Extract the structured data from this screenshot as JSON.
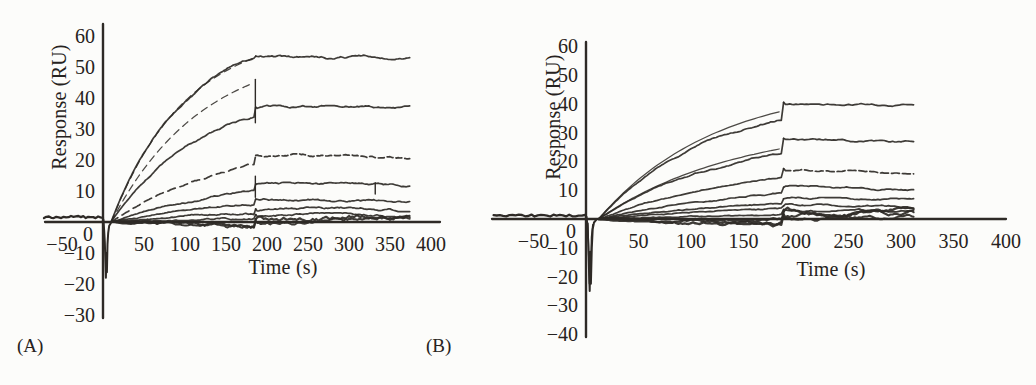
{
  "figure": {
    "background": "#fcfcfa",
    "ink": "#2e2a26",
    "text_color": "#262220"
  },
  "chart_data": [
    {
      "id": "A",
      "panel_label": "(A)",
      "type": "line",
      "title": "",
      "xlabel": "Time (s)",
      "ylabel": "Response (RU)",
      "x_ticks": [
        -50,
        50,
        100,
        150,
        200,
        250,
        300,
        350,
        400
      ],
      "y_ticks": [
        60,
        50,
        40,
        30,
        20,
        10,
        0,
        -10,
        -20,
        -30
      ],
      "xlim": [
        -75,
        415
      ],
      "ylim": [
        -33,
        63
      ],
      "grid": false,
      "legend": null,
      "injection": {
        "t_start": 10,
        "t_assoc_end": 185,
        "t_curve_end": 375,
        "t_baseline_start": -72,
        "baseline_level": 1.6,
        "neg_spike_min": -18,
        "neg_spike_double": false
      },
      "series": [
        {
          "name": "curve-1",
          "assoc_end": 53,
          "plateau": 53.5,
          "plateau_end": 53,
          "k": 0.011,
          "fit_end": 53,
          "fit_dash": "7 5"
        },
        {
          "name": "curve-2",
          "assoc_end": 34,
          "plateau": 37,
          "plateau_end": 36.8,
          "k": 0.009,
          "spike_to": 46,
          "fit_end": 45,
          "fit_dash": "7 5"
        },
        {
          "name": "curve-3",
          "assoc_end": 18.5,
          "plateau": 21.5,
          "plateau_end": 21,
          "k": 0.007,
          "assoc_dash": "8 5",
          "diss_dash": "6 3"
        },
        {
          "name": "curve-4",
          "assoc_end": 10,
          "plateau": 12.2,
          "plateau_end": 12,
          "k": 0.006,
          "spike_to": 14.8,
          "glitch_t": 332
        },
        {
          "name": "curve-5",
          "assoc_end": 5.5,
          "plateau": 7.4,
          "plateau_end": 7,
          "k": 0.005
        },
        {
          "name": "curve-6",
          "assoc_end": 3,
          "plateau": 4.2,
          "plateau_end": 4,
          "k": 0.0045
        },
        {
          "name": "curve-7",
          "assoc_end": 1.5,
          "plateau": 2.4,
          "plateau_end": 2.2,
          "k": 0.004
        },
        {
          "name": "baseline-band-1",
          "assoc_end": -2,
          "plateau": 0.9,
          "plateau_end": 0.8,
          "k": 0.004,
          "noise": 1.2,
          "width": 2.2
        },
        {
          "name": "baseline-band-2",
          "assoc_end": -0.6,
          "plateau": 0.3,
          "plateau_end": 0.3,
          "k": 0.003,
          "noise": 0.9,
          "width": 2.0
        }
      ]
    },
    {
      "id": "B",
      "panel_label": "(B)",
      "type": "line",
      "title": "",
      "xlabel": "Time (s)",
      "ylabel": "Response (RU)",
      "x_ticks": [
        -50,
        50,
        100,
        150,
        200,
        250,
        300,
        350,
        400
      ],
      "y_ticks": [
        60,
        50,
        40,
        30,
        20,
        10,
        0,
        -10,
        -20,
        -30,
        -40
      ],
      "xlim": [
        -90,
        415
      ],
      "ylim": [
        -43,
        63
      ],
      "grid": false,
      "legend": null,
      "injection": {
        "t_start": 12,
        "t_assoc_end": 187,
        "t_curve_end": 312,
        "t_baseline_start": -88,
        "baseline_level": 1.2,
        "neg_spike_min": -25,
        "neg_spike_double": true
      },
      "series": [
        {
          "name": "curve-1",
          "assoc_end": 35,
          "plateau": 40.5,
          "plateau_end": 39,
          "k": 0.009,
          "fit_end": 37.5
        },
        {
          "name": "curve-2",
          "assoc_end": 23,
          "plateau": 28,
          "plateau_end": 27,
          "k": 0.0075,
          "fit_end": 24.5
        },
        {
          "name": "curve-3",
          "assoc_end": 15,
          "plateau": 17.5,
          "plateau_end": 16.3,
          "k": 0.0065,
          "diss_dash": "8 3"
        },
        {
          "name": "curve-4",
          "assoc_end": 8.5,
          "plateau": 11,
          "plateau_end": 10.4,
          "k": 0.0055
        },
        {
          "name": "curve-5",
          "assoc_end": 5,
          "plateau": 7,
          "plateau_end": 6.4,
          "k": 0.005
        },
        {
          "name": "curve-6",
          "assoc_end": 3.2,
          "plateau": 4.6,
          "plateau_end": 4.3,
          "k": 0.0045
        },
        {
          "name": "curve-7",
          "assoc_end": 2,
          "plateau": 3.3,
          "plateau_end": 3.1,
          "k": 0.004
        },
        {
          "name": "baseline-band-1",
          "assoc_end": -1.6,
          "plateau": 2.6,
          "plateau_end": 2.4,
          "k": 0.004,
          "noise": 1.4,
          "width": 2.4
        },
        {
          "name": "baseline-band-2",
          "assoc_end": -0.6,
          "plateau": 1.6,
          "plateau_end": 1.5,
          "k": 0.003,
          "noise": 1.2,
          "width": 2.2
        },
        {
          "name": "baseline-band-3",
          "assoc_end": 0.4,
          "plateau": 0.6,
          "plateau_end": 0.5,
          "k": 0.003,
          "noise": 1.0,
          "width": 2.0
        }
      ]
    }
  ]
}
